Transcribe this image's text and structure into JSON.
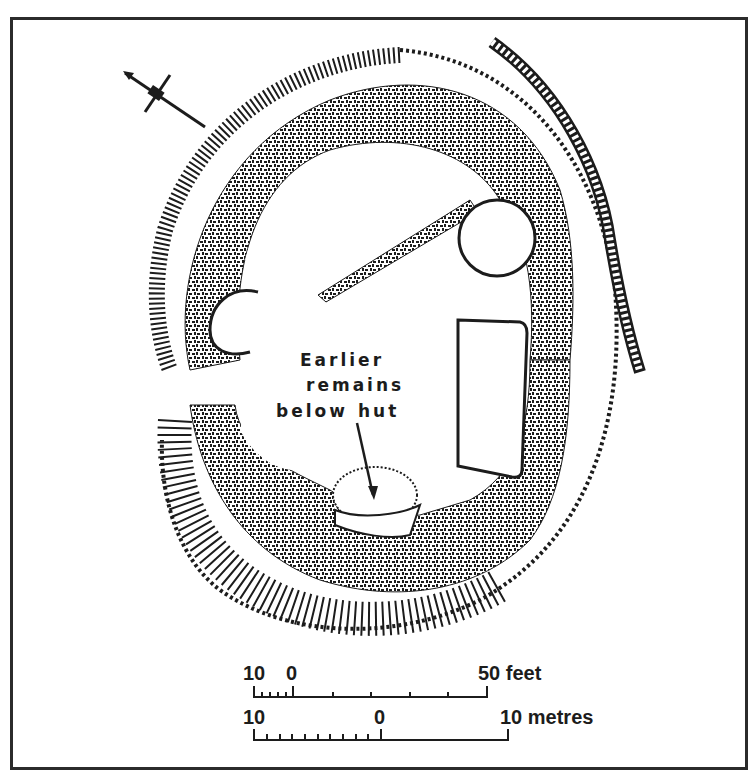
{
  "figure": {
    "type": "archaeological site plan",
    "frame_color": "#2b2b2b",
    "ink_color": "#1c1c1c",
    "background": "#ffffff"
  },
  "north_arrow": {
    "icon": "north-arrow-icon",
    "direction_deg": 150
  },
  "annotation": {
    "line1": "Earlier",
    "line2": "remains",
    "line3_left": "below",
    "line3_right": "hut"
  },
  "scale": {
    "feet": {
      "left_label": "10",
      "zero_label": "0",
      "right_label": "50 feet",
      "minor_ticks": 4,
      "major_ticks": 5
    },
    "metres": {
      "left_label": "10",
      "zero_label": "0",
      "right_label": "10 metres",
      "minor_ticks": 9
    }
  }
}
